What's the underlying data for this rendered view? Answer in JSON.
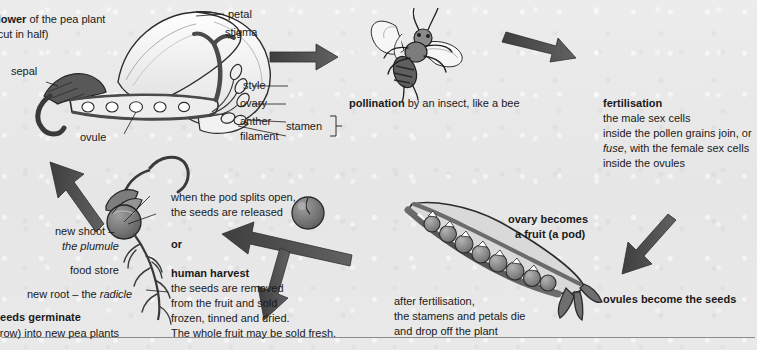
{
  "page": {
    "background_color": "#e9e9e9",
    "ink_color": "#1a1a1a",
    "arrow_color": "#4d4d4d"
  },
  "flower_diagram": {
    "title_bold": "flower",
    "title_rest": " of the pea plant",
    "subtitle": "(cut in half)",
    "labels": {
      "petal": "petal",
      "stigma": "stigma",
      "style": "style",
      "ovary": "ovary",
      "anther": "anther",
      "filament": "filament",
      "stamen": "stamen",
      "sepal": "sepal",
      "ovule": "ovule"
    }
  },
  "pollination": {
    "bold": "pollination",
    "rest": " by an insect, like a bee"
  },
  "fertilisation": {
    "heading": "fertilisation",
    "line1": "the male sex cells",
    "line2": "inside the pollen grains join, or",
    "line3_italic": "fuse",
    "line3_rest": ", with the female sex cells",
    "line4": "inside the ovules"
  },
  "fruit": {
    "heading_line1": "ovary becomes",
    "heading_line2": "a fruit (a pod)",
    "ovules_seeds": "ovules become the seeds",
    "after_fertilisation_line1": "after fertilisation,",
    "after_fertilisation_line2": "the stamens and petals die",
    "after_fertilisation_line3": "and drop off the plant"
  },
  "pod_splits": {
    "line1": "when the pod splits open,",
    "line2": "the seeds are released",
    "or": "or"
  },
  "human_harvest": {
    "heading": "human harvest",
    "line1": "the seeds are removed",
    "line2": "from the fruit and sold",
    "line3": "frozen, tinned and dried.",
    "line4": "The whole fruit may be sold fresh."
  },
  "germination": {
    "new_shoot_line1": "new shoot –",
    "new_shoot_line2_italic": "the plumule",
    "food_store": "food store",
    "new_root_pre": "new root – the ",
    "new_root_italic": "radicle",
    "heading": "seeds germinate",
    "subtext": "(grow) into new pea plants"
  }
}
